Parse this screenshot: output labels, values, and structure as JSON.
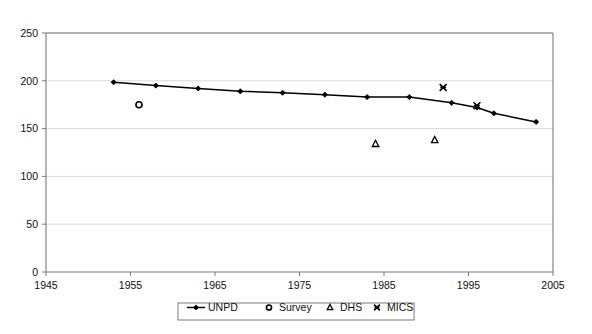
{
  "chart_data": {
    "type": "line",
    "title": "",
    "xlabel": "",
    "ylabel": "",
    "xlim": [
      1945,
      2005
    ],
    "ylim": [
      0,
      250
    ],
    "xticks": [
      1945,
      1955,
      1965,
      1975,
      1985,
      1995,
      2005
    ],
    "yticks": [
      0,
      50,
      100,
      150,
      200,
      250
    ],
    "xtick_labels": [
      "1945",
      "1955",
      "1965",
      "1975",
      "1985",
      "1995",
      "2005"
    ],
    "ytick_labels": [
      "0",
      "50",
      "100",
      "150",
      "200",
      "250"
    ],
    "grid": "horizontal",
    "legend_position": "bottom",
    "series": [
      {
        "name": "UNPD",
        "marker": "diamond",
        "line": true,
        "color": "#000000",
        "x": [
          1953,
          1958,
          1963,
          1968,
          1973,
          1978,
          1983,
          1988,
          1993,
          1996,
          1998,
          2003
        ],
        "values": [
          198.5,
          195,
          192,
          189,
          187.5,
          185.5,
          183,
          183,
          177,
          172,
          166,
          157
        ]
      },
      {
        "name": "Survey",
        "marker": "open-circle",
        "line": false,
        "color": "#000000",
        "x": [
          1956
        ],
        "values": [
          175
        ]
      },
      {
        "name": "DHS",
        "marker": "open-triangle",
        "line": false,
        "color": "#000000",
        "x": [
          1984,
          1991
        ],
        "values": [
          134,
          138
        ]
      },
      {
        "name": "MICS",
        "marker": "star-x",
        "line": false,
        "color": "#000000",
        "x": [
          1992,
          1996
        ],
        "values": [
          193,
          174
        ]
      }
    ]
  },
  "legend": {
    "items": [
      {
        "label": "UNPD",
        "marker": "line-diamond"
      },
      {
        "label": "Survey",
        "marker": "open-circle"
      },
      {
        "label": "DHS",
        "marker": "open-triangle"
      },
      {
        "label": "MICS",
        "marker": "star-x"
      }
    ]
  },
  "colors": {
    "axis": "#7a7a7a",
    "grid": "#d9d9d9",
    "series": "#000000",
    "background": "#ffffff"
  }
}
